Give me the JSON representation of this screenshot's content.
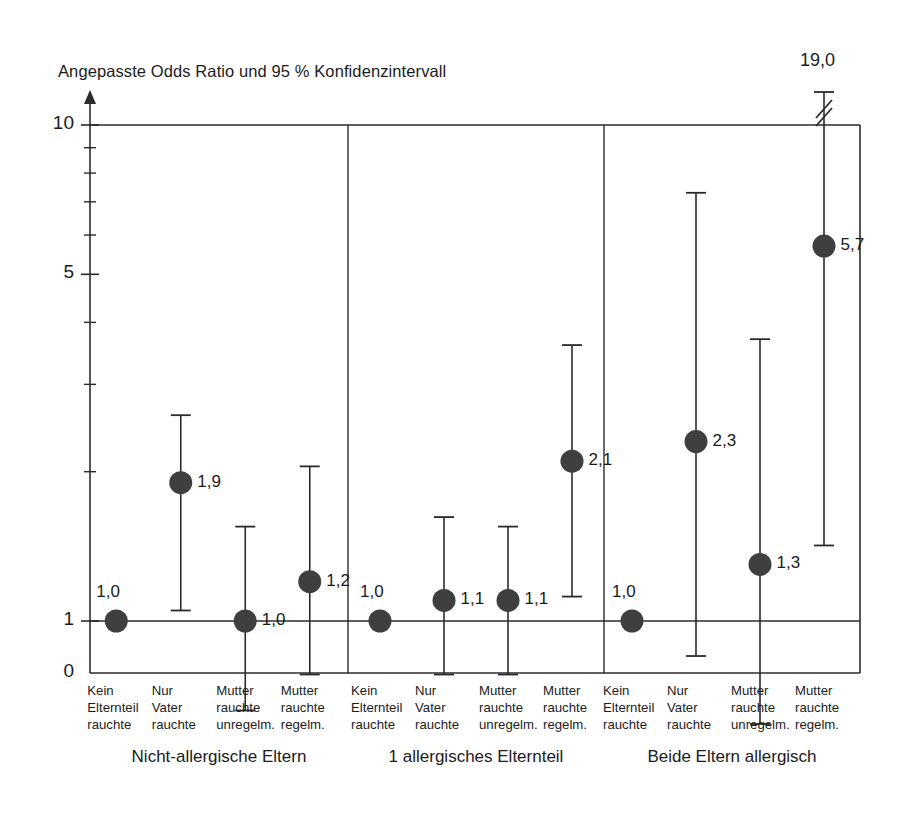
{
  "chart_data": {
    "type": "scatter",
    "title": "Angepasste Odds Ratio und 95 % Konfidenzintervall",
    "xlabel": "",
    "ylabel": "",
    "yscale": "log",
    "ylim": [
      0.55,
      10
    ],
    "y_tick_labels": [
      "10",
      "5",
      "1",
      "0"
    ],
    "y_major_ticks": [
      10,
      5,
      1
    ],
    "y_minor_ticks": [
      9,
      8,
      7,
      6,
      4,
      3,
      2
    ],
    "grid": false,
    "legend": "none",
    "axis_break_note": "19,0",
    "categories": [
      "Kein\nElternteil\nrauchte",
      "Nur\nVater\nrauchte",
      "Mutter\nrauchte\nunregelm.",
      "Mutter\nrauchte\nregelm."
    ],
    "groups": [
      {
        "name": "Nicht-allergische Eltern",
        "points": [
          {
            "category": "Kein\nElternteil\nrauchte",
            "value": 1.0,
            "label": "1,0",
            "ci_low": null,
            "ci_high": null,
            "label_pos": "above"
          },
          {
            "category": "Nur\nVater\nrauchte",
            "value": 1.9,
            "label": "1,9",
            "ci_low": 1.05,
            "ci_high": 2.6,
            "label_pos": "right"
          },
          {
            "category": "Mutter\nrauchte\nunregelm.",
            "value": 1.0,
            "label": "1,0",
            "ci_low": 0.66,
            "ci_high": 1.55,
            "label_pos": "right"
          },
          {
            "category": "Mutter\nrauchte\nregelm.",
            "value": 1.2,
            "label": "1,2",
            "ci_low": 0.78,
            "ci_high": 2.05,
            "label_pos": "right"
          }
        ]
      },
      {
        "name": "1 allergisches Elternteil",
        "points": [
          {
            "category": "Kein\nElternteil\nrauchte",
            "value": 1.0,
            "label": "1,0",
            "ci_low": null,
            "ci_high": null,
            "label_pos": "above"
          },
          {
            "category": "Nur\nVater\nrauchte",
            "value": 1.1,
            "label": "1,1",
            "ci_low": 0.78,
            "ci_high": 1.62,
            "label_pos": "right"
          },
          {
            "category": "Mutter\nrauchte\nunregelm.",
            "value": 1.1,
            "label": "1,1",
            "ci_low": 0.78,
            "ci_high": 1.55,
            "label_pos": "right"
          },
          {
            "category": "Mutter\nrauchte\nregelm.",
            "value": 2.1,
            "label": "2,1",
            "ci_low": 1.12,
            "ci_high": 3.6,
            "label_pos": "right"
          }
        ]
      },
      {
        "name": "Beide Eltern allergisch",
        "points": [
          {
            "category": "Kein\nElternteil\nrauchte",
            "value": 1.0,
            "label": "1,0",
            "ci_low": null,
            "ci_high": null,
            "label_pos": "above"
          },
          {
            "category": "Nur\nVater\nrauchte",
            "value": 2.3,
            "label": "2,3",
            "ci_low": 0.85,
            "ci_high": 7.3,
            "label_pos": "right"
          },
          {
            "category": "Mutter\nrauchte\nunregelm.",
            "value": 1.3,
            "label": "1,3",
            "ci_low": 0.62,
            "ci_high": 3.7,
            "label_pos": "right"
          },
          {
            "category": "Mutter\nrauchte\nregelm.",
            "value": 5.7,
            "label": "5,7",
            "ci_low": 1.42,
            "ci_high": 19.0,
            "label_pos": "right",
            "ci_high_broken": true,
            "ci_high_label": "19,0"
          }
        ]
      }
    ],
    "marker_color": "#3f3f3f",
    "line_color": "#2b2b2b"
  }
}
